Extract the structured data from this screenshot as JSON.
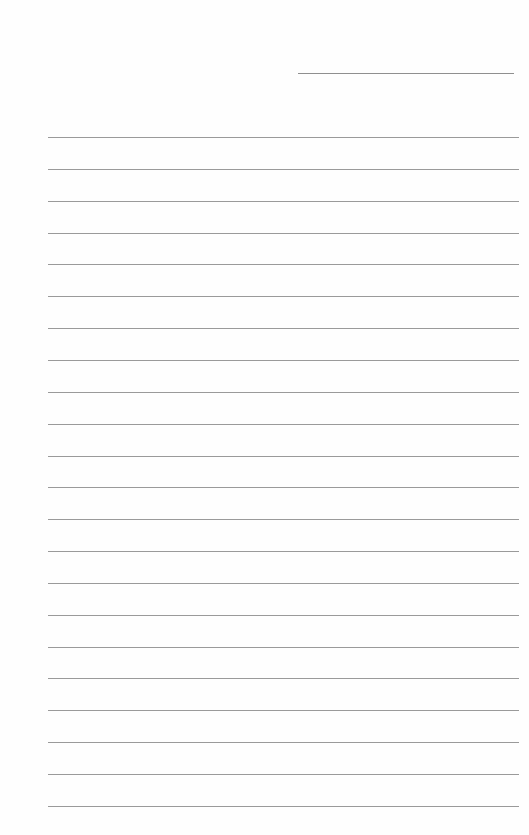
{
  "document": {
    "type": "lined-paper",
    "header_line": {
      "x": 298,
      "y": 73,
      "width": 216
    },
    "rules": {
      "count": 22,
      "start_y": 137,
      "spacing": 31.85,
      "x": 48,
      "width": 471
    },
    "colors": {
      "background": "#fefefe",
      "rule": "#9a9a9a",
      "header_rule": "#8f8f8f"
    }
  }
}
